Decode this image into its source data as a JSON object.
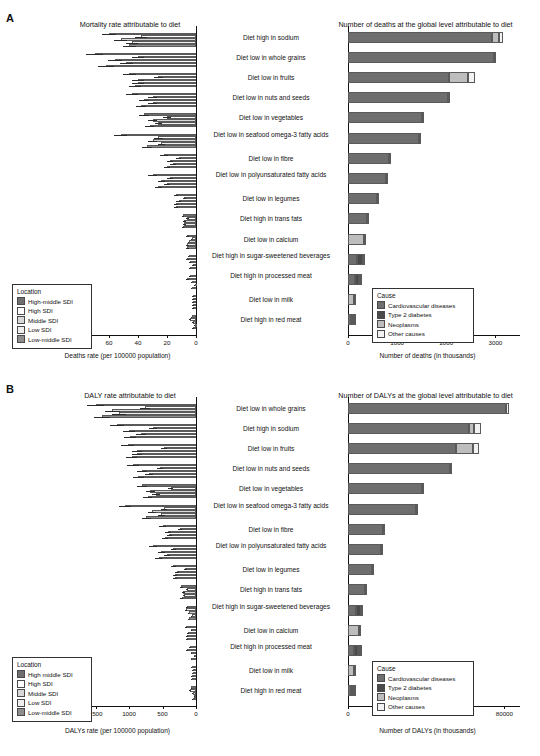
{
  "panels": [
    {
      "letter": "A"
    },
    {
      "letter": "B"
    }
  ],
  "chart_data": [
    {
      "type": "bar",
      "id": "A-left",
      "title": "Mortality rate attributable to diet",
      "xlabel": "Deaths rate (per 100000 population)",
      "ylabel": "",
      "orientation": "horizontal-left",
      "xlim": [
        0,
        120
      ],
      "xticks": [
        120,
        100,
        80,
        60,
        40,
        20,
        0
      ],
      "grid": false,
      "legend_title": "Location",
      "legend_position": "bottom-left",
      "series": [
        {
          "name": "High-middle SDI",
          "color": "#6e6e6e"
        },
        {
          "name": "High SDI",
          "color": "#ffffff"
        },
        {
          "name": "Middle SDI",
          "color": "#d8d8d8"
        },
        {
          "name": "Low SDI",
          "color": "#efefef"
        },
        {
          "name": "Low-middle SDI",
          "color": "#8e8e8e"
        }
      ],
      "categories": [
        "Diet high in sodium",
        "Diet low in whole grains",
        "Diet low in fruits",
        "Diet low in nuts and seeds",
        "Diet low in vegetables",
        "Diet low in seafood omega-3 fatty acids",
        "Diet low in fibre",
        "Diet low in polyunsaturated fatty acids",
        "Diet low in legumes",
        "Diet high in trans fats",
        "Diet low in calcium",
        "Diet high in sugar-sweetened beverages",
        "Diet high in processed meat",
        "Diet low in milk",
        "Diet high in red meat"
      ],
      "values": [
        [
          60,
          38,
          52,
          44,
          46
        ],
        [
          70,
          40,
          56,
          48,
          62
        ],
        [
          46,
          26,
          40,
          40,
          42
        ],
        [
          44,
          30,
          36,
          30,
          38
        ],
        [
          36,
          20,
          30,
          26,
          32
        ],
        [
          52,
          26,
          30,
          24,
          34
        ],
        [
          22,
          12,
          18,
          16,
          20
        ],
        [
          30,
          18,
          24,
          20,
          26
        ],
        [
          14,
          8,
          12,
          14,
          14
        ],
        [
          9,
          6,
          8,
          8,
          9
        ],
        [
          6,
          3,
          5,
          6,
          6
        ],
        [
          5,
          6,
          4,
          2,
          4
        ],
        [
          4,
          6,
          3,
          1,
          3
        ],
        [
          2,
          2,
          2,
          2,
          2
        ],
        [
          3,
          4,
          2,
          1,
          2
        ]
      ],
      "error": [
        [
          10,
          8,
          9,
          8,
          9
        ],
        [
          12,
          8,
          10,
          9,
          11
        ],
        [
          9,
          6,
          8,
          8,
          8
        ],
        [
          8,
          6,
          7,
          6,
          7
        ],
        [
          7,
          5,
          6,
          5,
          6
        ],
        [
          9,
          6,
          6,
          5,
          7
        ],
        [
          5,
          3,
          4,
          4,
          4
        ],
        [
          6,
          4,
          5,
          4,
          5
        ],
        [
          3,
          2,
          3,
          3,
          3
        ],
        [
          2,
          2,
          2,
          2,
          2
        ],
        [
          2,
          1,
          1,
          2,
          2
        ],
        [
          1,
          2,
          1,
          1,
          1
        ],
        [
          1,
          2,
          1,
          1,
          1
        ],
        [
          1,
          1,
          1,
          1,
          1
        ],
        [
          1,
          1,
          1,
          1,
          1
        ]
      ]
    },
    {
      "type": "bar",
      "id": "A-right",
      "title": "Number of deaths at the global level attributable to diet",
      "xlabel": "Number of deaths (in thousands)",
      "ylabel": "",
      "orientation": "horizontal-right",
      "stacked": true,
      "xlim": [
        0,
        3500
      ],
      "xticks": [
        0,
        1000,
        2000,
        3000
      ],
      "grid": false,
      "legend_title": "Cause",
      "legend_position": "bottom-right",
      "series": [
        {
          "name": "Cardiovascular diseases",
          "color": "#6e6e6e"
        },
        {
          "name": "Type 2 diabetes",
          "color": "#4a4a4a"
        },
        {
          "name": "Neoplasms",
          "color": "#bdbdbd"
        },
        {
          "name": "Other causes",
          "color": "#f2f2f2"
        }
      ],
      "categories": [
        "Diet high in sodium",
        "Diet low in whole grains",
        "Diet low in fruits",
        "Diet low in nuts and seeds",
        "Diet low in vegetables",
        "Diet low in seafood omega-3 fatty acids",
        "Diet low in fibre",
        "Diet low in polyunsaturated fatty acids",
        "Diet low in legumes",
        "Diet high in trans fats",
        "Diet low in calcium",
        "Diet high in sugar-sweetened beverages",
        "Diet high in processed meat",
        "Diet low in milk",
        "Diet high in red meat"
      ],
      "values": [
        [
          2930,
          0,
          140,
          90
        ],
        [
          2980,
          0,
          0,
          40
        ],
        [
          2060,
          0,
          390,
          130
        ],
        [
          2040,
          0,
          0,
          30
        ],
        [
          1500,
          0,
          0,
          20
        ],
        [
          1450,
          0,
          0,
          20
        ],
        [
          830,
          0,
          0,
          25
        ],
        [
          780,
          0,
          0,
          20
        ],
        [
          590,
          0,
          0,
          15
        ],
        [
          380,
          0,
          0,
          10
        ],
        [
          0,
          0,
          320,
          10
        ],
        [
          190,
          120,
          0,
          10
        ],
        [
          150,
          70,
          30,
          10
        ],
        [
          0,
          0,
          120,
          10
        ],
        [
          60,
          20,
          40,
          10
        ]
      ]
    },
    {
      "type": "bar",
      "id": "B-left",
      "title": "DALY rate attributable to diet",
      "xlabel": "DALYs rate (per 100000 population)",
      "ylabel": "",
      "orientation": "horizontal-left",
      "xlim": [
        0,
        2600
      ],
      "xticks": [
        2500,
        2000,
        1500,
        1000,
        500,
        0
      ],
      "grid": false,
      "legend_title": "Location",
      "legend_position": "bottom-left",
      "series": [
        {
          "name": "High middle SDI",
          "color": "#6e6e6e"
        },
        {
          "name": "High SDI",
          "color": "#ffffff"
        },
        {
          "name": "Middle SDI",
          "color": "#d8d8d8"
        },
        {
          "name": "Low SDI",
          "color": "#efefef"
        },
        {
          "name": "Low-middle SDI",
          "color": "#8e8e8e"
        }
      ],
      "categories": [
        "Diet low in whole grains",
        "Diet high in sodium",
        "Diet low in fruits",
        "Diet low in nuts and seeds",
        "Diet low in vegetables",
        "Diet low in seafood omega-3 fatty acids",
        "Diet low in fibre",
        "Diet low in polyunsaturated fatty acids",
        "Diet low in legumes",
        "Diet high in trans fats",
        "Diet high in sugar-sweetened beverages",
        "Diet low in calcium",
        "Diet high in processed meat",
        "Diet low in milk",
        "Diet high in red meat"
      ],
      "values": [
        [
          1500,
          760,
          1250,
          1150,
          1400
        ],
        [
          1180,
          640,
          1000,
          820,
          980
        ],
        [
          1020,
          480,
          880,
          880,
          960
        ],
        [
          940,
          540,
          800,
          700,
          860
        ],
        [
          800,
          380,
          680,
          600,
          720
        ],
        [
          1060,
          480,
          660,
          520,
          740
        ],
        [
          500,
          240,
          420,
          400,
          460
        ],
        [
          640,
          340,
          520,
          440,
          560
        ],
        [
          340,
          160,
          280,
          320,
          320
        ],
        [
          220,
          140,
          190,
          180,
          210
        ],
        [
          130,
          150,
          110,
          60,
          110
        ],
        [
          150,
          70,
          120,
          140,
          140
        ],
        [
          90,
          130,
          70,
          30,
          70
        ],
        [
          60,
          50,
          50,
          60,
          60
        ],
        [
          70,
          90,
          50,
          25,
          50
        ]
      ],
      "error": [
        [
          260,
          140,
          220,
          200,
          240
        ],
        [
          210,
          120,
          180,
          150,
          180
        ],
        [
          190,
          100,
          160,
          160,
          170
        ],
        [
          170,
          100,
          150,
          130,
          160
        ],
        [
          150,
          80,
          130,
          110,
          130
        ],
        [
          190,
          90,
          120,
          100,
          140
        ],
        [
          100,
          50,
          90,
          80,
          90
        ],
        [
          120,
          70,
          100,
          90,
          110
        ],
        [
          70,
          40,
          60,
          60,
          60
        ],
        [
          50,
          30,
          40,
          40,
          45
        ],
        [
          30,
          35,
          25,
          15,
          25
        ],
        [
          35,
          20,
          30,
          30,
          30
        ],
        [
          20,
          30,
          15,
          10,
          15
        ],
        [
          15,
          12,
          12,
          15,
          15
        ],
        [
          18,
          20,
          12,
          8,
          12
        ]
      ]
    },
    {
      "type": "bar",
      "id": "B-right",
      "title": "Number of DALYs at the global level attributable to diet",
      "xlabel": "Number of DALYs (in thousands)",
      "ylabel": "",
      "orientation": "horizontal-right",
      "stacked": true,
      "xlim": [
        0,
        88000
      ],
      "xticks": [
        0,
        20000,
        40000,
        60000,
        80000
      ],
      "grid": false,
      "legend_title": "Cause",
      "legend_position": "bottom-right",
      "series": [
        {
          "name": "Cardiovascular diseases",
          "color": "#6e6e6e"
        },
        {
          "name": "Type 2 diabetes",
          "color": "#4a4a4a"
        },
        {
          "name": "Neoplasms",
          "color": "#bdbdbd"
        },
        {
          "name": "Other causes",
          "color": "#f2f2f2"
        }
      ],
      "categories": [
        "Diet low in whole grains",
        "Diet high in sodium",
        "Diet low in fruits",
        "Diet low in nuts and seeds",
        "Diet low in vegetables",
        "Diet low in seafood omega-3 fatty acids",
        "Diet low in fibre",
        "Diet low in polyunsaturated fatty acids",
        "Diet low in legumes",
        "Diet high in trans fats",
        "Diet high in sugar-sweetened beverages",
        "Diet low in calcium",
        "Diet high in processed meat",
        "Diet low in milk",
        "Diet high in red meat"
      ],
      "values": [
        [
          81000,
          0,
          0,
          1500
        ],
        [
          62000,
          0,
          2500,
          3500
        ],
        [
          55000,
          0,
          9000,
          3000
        ],
        [
          52000,
          0,
          0,
          1200
        ],
        [
          38000,
          0,
          0,
          900
        ],
        [
          35000,
          0,
          0,
          800
        ],
        [
          18000,
          0,
          0,
          700
        ],
        [
          17000,
          0,
          0,
          600
        ],
        [
          12500,
          0,
          0,
          400
        ],
        [
          8500,
          0,
          0,
          300
        ],
        [
          4200,
          2600,
          0,
          300
        ],
        [
          0,
          0,
          5500,
          200
        ],
        [
          3200,
          1800,
          900,
          200
        ],
        [
          0,
          0,
          3000,
          200
        ],
        [
          1500,
          600,
          900,
          200
        ]
      ]
    }
  ]
}
